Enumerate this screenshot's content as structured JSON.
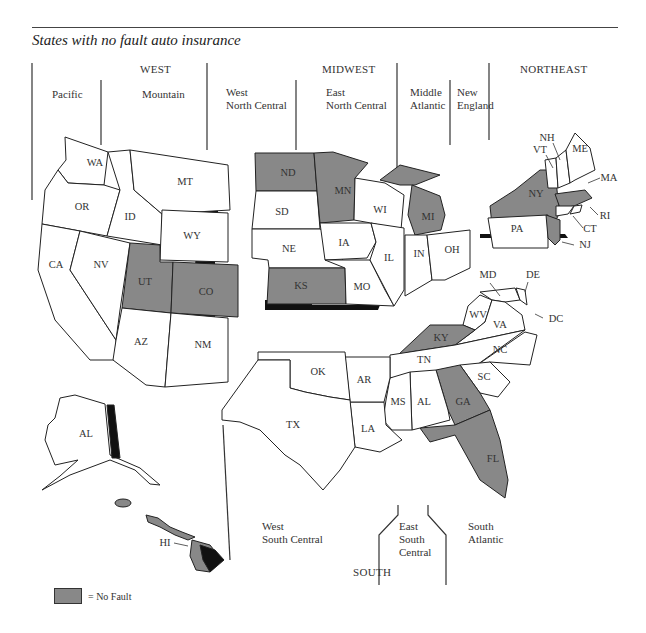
{
  "title": "States with no fault auto insurance",
  "colors": {
    "no_fault": "#888888",
    "other": "#ffffff",
    "shadow": "#111111",
    "outline": "#222222"
  },
  "regions": {
    "west": {
      "label": "WEST",
      "divisions": [
        {
          "label": "Pacific"
        },
        {
          "label": "Mountain"
        }
      ]
    },
    "midwest": {
      "label": "MIDWEST",
      "divisions": [
        {
          "label": "West\nNorth Central"
        },
        {
          "label": "East\nNorth Central"
        }
      ]
    },
    "northeast": {
      "label": "NORTHEAST",
      "divisions": [
        {
          "label": "Middle\nAtlantic"
        },
        {
          "label": "New\nEngland"
        }
      ]
    },
    "south": {
      "label": "SOUTH",
      "divisions": [
        {
          "label": "West\nSouth Central"
        },
        {
          "label": "East\nSouth\nCentral"
        },
        {
          "label": "South\nAtlantic"
        }
      ]
    }
  },
  "states": {
    "WA": {
      "label": "WA",
      "no_fault": false
    },
    "OR": {
      "label": "OR",
      "no_fault": false
    },
    "CA": {
      "label": "CA",
      "no_fault": false
    },
    "NV": {
      "label": "NV",
      "no_fault": false
    },
    "ID": {
      "label": "ID",
      "no_fault": false
    },
    "MT": {
      "label": "MT",
      "no_fault": false
    },
    "WY": {
      "label": "WY",
      "no_fault": false
    },
    "UT": {
      "label": "UT",
      "no_fault": true
    },
    "CO": {
      "label": "CO",
      "no_fault": true
    },
    "AZ": {
      "label": "AZ",
      "no_fault": false
    },
    "NM": {
      "label": "NM",
      "no_fault": false
    },
    "ND": {
      "label": "ND",
      "no_fault": true
    },
    "SD": {
      "label": "SD",
      "no_fault": false
    },
    "NE": {
      "label": "NE",
      "no_fault": false
    },
    "KS": {
      "label": "KS",
      "no_fault": true
    },
    "MN": {
      "label": "MN",
      "no_fault": true
    },
    "IA": {
      "label": "IA",
      "no_fault": false
    },
    "MO": {
      "label": "MO",
      "no_fault": false
    },
    "WI": {
      "label": "WI",
      "no_fault": false
    },
    "IL": {
      "label": "IL",
      "no_fault": false
    },
    "MI": {
      "label": "MI",
      "no_fault": true
    },
    "IN": {
      "label": "IN",
      "no_fault": false
    },
    "OH": {
      "label": "OH",
      "no_fault": false
    },
    "NY": {
      "label": "NY",
      "no_fault": true
    },
    "PA": {
      "label": "PA",
      "no_fault": false
    },
    "NJ": {
      "label": "NJ",
      "no_fault": true
    },
    "VT": {
      "label": "VT",
      "no_fault": false
    },
    "NH": {
      "label": "NH",
      "no_fault": false
    },
    "ME": {
      "label": "ME",
      "no_fault": false
    },
    "MA": {
      "label": "MA",
      "no_fault": true
    },
    "RI": {
      "label": "RI",
      "no_fault": false
    },
    "CT": {
      "label": "CT",
      "no_fault": false
    },
    "MD": {
      "label": "MD",
      "no_fault": false
    },
    "DE": {
      "label": "DE",
      "no_fault": false
    },
    "DC": {
      "label": "DC",
      "no_fault": false
    },
    "WV": {
      "label": "WV",
      "no_fault": false
    },
    "VA": {
      "label": "VA",
      "no_fault": false
    },
    "KY": {
      "label": "KY",
      "no_fault": true
    },
    "TN": {
      "label": "TN",
      "no_fault": false
    },
    "NC": {
      "label": "NC",
      "no_fault": false
    },
    "SC": {
      "label": "SC",
      "no_fault": false
    },
    "GA": {
      "label": "GA",
      "no_fault": true
    },
    "FL": {
      "label": "FL",
      "no_fault": true
    },
    "AL": {
      "label": "AL",
      "no_fault": false
    },
    "MS": {
      "label": "MS",
      "no_fault": false
    },
    "LA": {
      "label": "LA",
      "no_fault": false
    },
    "AR": {
      "label": "AR",
      "no_fault": false
    },
    "OK": {
      "label": "OK",
      "no_fault": false
    },
    "TX": {
      "label": "TX",
      "no_fault": false
    },
    "AK": {
      "label": "AL",
      "no_fault": false
    },
    "HI": {
      "label": "HI",
      "no_fault": true
    }
  },
  "legend": {
    "label": "= No Fault"
  }
}
